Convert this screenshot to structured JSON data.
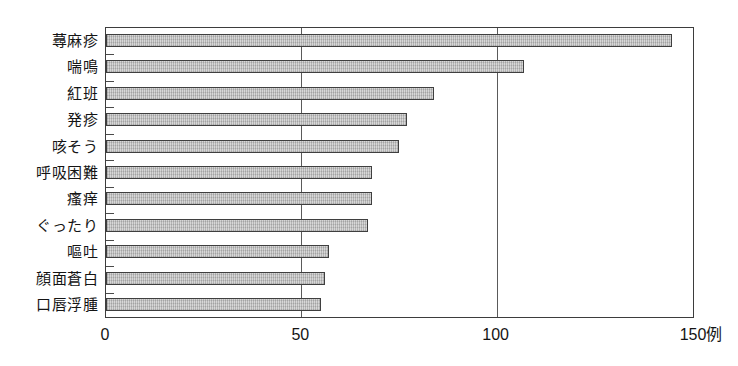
{
  "chart_data": {
    "type": "bar",
    "orientation": "horizontal",
    "title": "",
    "xlabel": "",
    "ylabel": "",
    "unit_suffix": "例",
    "categories": [
      "蕁麻疹",
      "喘鳴",
      "紅班",
      "発疹",
      "咳そう",
      "呼吸困難",
      "瘙痒",
      "ぐったり",
      "嘔吐",
      "顔面蒼白",
      "口唇浮腫"
    ],
    "values": [
      145,
      107,
      84,
      77,
      75,
      68,
      68,
      67,
      57,
      56,
      55
    ],
    "xlim": [
      0,
      150
    ],
    "xticks": [
      0,
      50,
      100,
      150
    ],
    "xtick_labels": [
      "0",
      "50",
      "100",
      "150例"
    ],
    "grid": "vertical gridlines at 50 and 100",
    "legend": null,
    "colors": {
      "bar_fill": "#c9c9c9",
      "bar_border": "#3f3f3f",
      "plot_border": "#3d3d3d",
      "gridline": "#5a5a5a",
      "text": "#141414",
      "background": "#ffffff"
    }
  }
}
